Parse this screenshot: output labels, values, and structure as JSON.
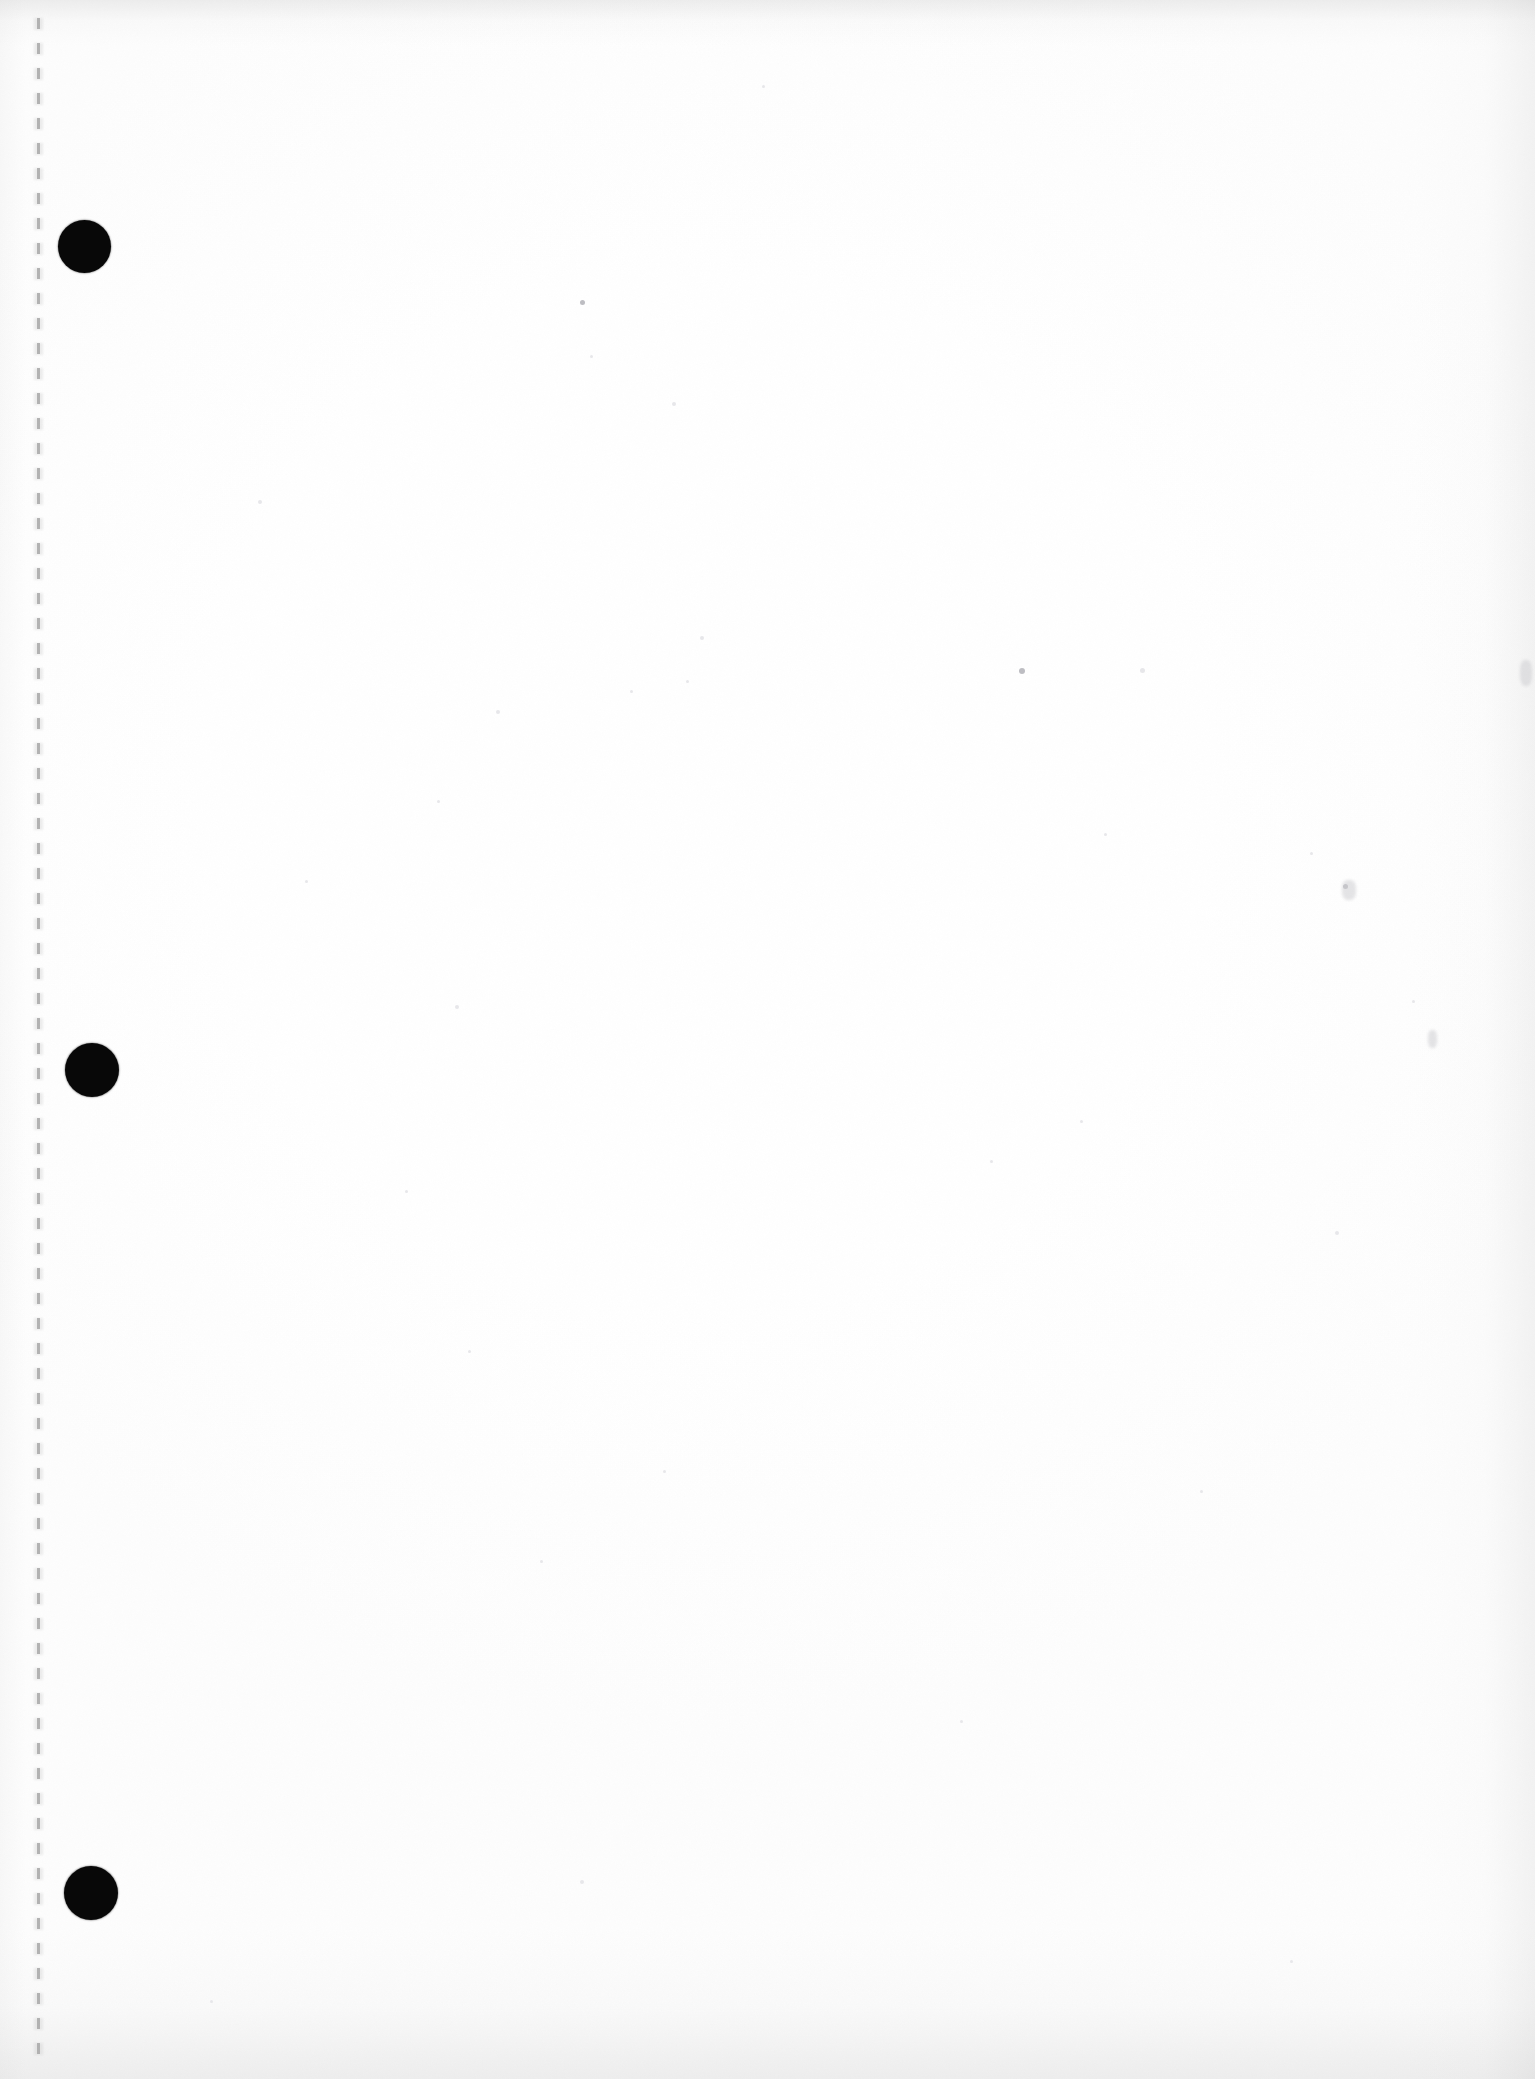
{
  "document": {
    "type": "scanned-page",
    "title": "Blank Scanned Page",
    "page_label": "",
    "body_text": "",
    "content_note": "",
    "width_px": 1535,
    "height_px": 2079,
    "orientation": "portrait",
    "background_color": "#ffffff"
  },
  "page_features": {
    "fold_line": {
      "name": "dashed-binding-line",
      "label": "",
      "color": "#a8a8a8",
      "x_px": 38,
      "top_px": 18,
      "bottom_px": 2066,
      "dash_length_px": 11,
      "gap_length_px": 14,
      "thickness_px": 3
    },
    "punch_holes": {
      "color": "#080808",
      "count": 3,
      "items": [
        {
          "name": "punch-hole-top",
          "cx": 84,
          "cy": 246,
          "d": 53
        },
        {
          "name": "punch-hole-middle",
          "cx": 92,
          "cy": 1070,
          "d": 54
        },
        {
          "name": "punch-hole-bottom",
          "cx": 91,
          "cy": 1893,
          "d": 54
        }
      ]
    },
    "edge_shading": {
      "name": "scan-edge-vignette",
      "top_color": "#f1f1f1",
      "bottom_color": "#f0f0f0",
      "right_color": "#f5f5f5"
    },
    "specks": [
      {
        "x": 258,
        "y": 500,
        "s": 4,
        "t": "faint"
      },
      {
        "x": 580,
        "y": 300,
        "s": 5,
        "t": "dark"
      },
      {
        "x": 762,
        "y": 85,
        "s": 3,
        "t": "faint"
      },
      {
        "x": 672,
        "y": 402,
        "s": 4,
        "t": "faint"
      },
      {
        "x": 590,
        "y": 355,
        "s": 3,
        "t": "faint"
      },
      {
        "x": 700,
        "y": 636,
        "s": 4,
        "t": "faint"
      },
      {
        "x": 686,
        "y": 680,
        "s": 3,
        "t": "faint"
      },
      {
        "x": 630,
        "y": 690,
        "s": 3,
        "t": "faint"
      },
      {
        "x": 1019,
        "y": 668,
        "s": 6,
        "t": "dark"
      },
      {
        "x": 1140,
        "y": 668,
        "s": 5,
        "t": "faint"
      },
      {
        "x": 496,
        "y": 710,
        "s": 4,
        "t": "faint"
      },
      {
        "x": 437,
        "y": 800,
        "s": 3,
        "t": "faint"
      },
      {
        "x": 305,
        "y": 880,
        "s": 3,
        "t": "faint"
      },
      {
        "x": 1104,
        "y": 833,
        "s": 3,
        "t": "faint"
      },
      {
        "x": 1343,
        "y": 884,
        "s": 5,
        "t": "dark"
      },
      {
        "x": 1310,
        "y": 852,
        "s": 3,
        "t": "faint"
      },
      {
        "x": 1412,
        "y": 1000,
        "s": 3,
        "t": "faint"
      },
      {
        "x": 455,
        "y": 1005,
        "s": 4,
        "t": "faint"
      },
      {
        "x": 1080,
        "y": 1120,
        "s": 3,
        "t": "faint"
      },
      {
        "x": 990,
        "y": 1160,
        "s": 3,
        "t": "faint"
      },
      {
        "x": 405,
        "y": 1190,
        "s": 3,
        "t": "faint"
      },
      {
        "x": 1335,
        "y": 1231,
        "s": 4,
        "t": "faint"
      },
      {
        "x": 468,
        "y": 1350,
        "s": 3,
        "t": "faint"
      },
      {
        "x": 663,
        "y": 1470,
        "s": 3,
        "t": "faint"
      },
      {
        "x": 1200,
        "y": 1490,
        "s": 3,
        "t": "faint"
      },
      {
        "x": 540,
        "y": 1560,
        "s": 3,
        "t": "faint"
      },
      {
        "x": 960,
        "y": 1720,
        "s": 3,
        "t": "faint"
      },
      {
        "x": 580,
        "y": 1880,
        "s": 4,
        "t": "faint"
      },
      {
        "x": 1290,
        "y": 1960,
        "s": 3,
        "t": "faint"
      },
      {
        "x": 210,
        "y": 2000,
        "s": 3,
        "t": "faint"
      }
    ],
    "smudges": [
      {
        "x": 1520,
        "y": 660,
        "w": 12,
        "h": 26
      },
      {
        "x": 1428,
        "y": 1030,
        "w": 9,
        "h": 18
      },
      {
        "x": 1342,
        "y": 880,
        "w": 14,
        "h": 20
      }
    ]
  }
}
